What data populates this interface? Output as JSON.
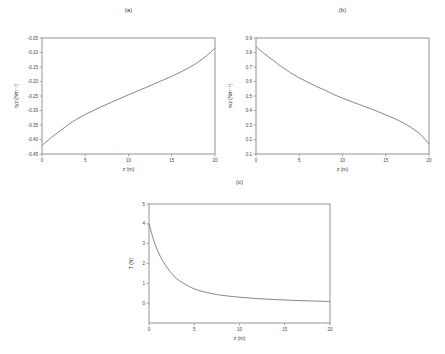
{
  "chart_data": [
    {
      "id": "a",
      "type": "line",
      "panel_label": "(a)",
      "title": "",
      "xlabel": "z (m)",
      "ylabel": "τyz (Nm⁻¹)",
      "xlim": [
        0,
        20
      ],
      "ylim": [
        -0.45,
        -0.05
      ],
      "xticks": [
        0,
        5,
        10,
        15,
        20
      ],
      "xtick_labels": [
        "0",
        "5",
        "10",
        "15",
        "20"
      ],
      "yticks": [
        -0.45,
        -0.4,
        -0.35,
        -0.3,
        -0.25,
        -0.2,
        -0.15,
        -0.1,
        -0.05
      ],
      "ytick_labels": [
        "-0.45",
        "-0.40",
        "-0.35",
        "-0.30",
        "-0.25",
        "-0.20",
        "-0.15",
        "-0.10",
        "-0.05"
      ],
      "grid": false,
      "series": [
        {
          "name": "tau_yz",
          "x": [
            0,
            1,
            2,
            3,
            4,
            5,
            6,
            7,
            8,
            9,
            10,
            11,
            12,
            13,
            14,
            15,
            16,
            17,
            18,
            19,
            20
          ],
          "y": [
            -0.42,
            -0.395,
            -0.372,
            -0.35,
            -0.33,
            -0.314,
            -0.299,
            -0.285,
            -0.272,
            -0.259,
            -0.246,
            -0.233,
            -0.221,
            -0.208,
            -0.195,
            -0.182,
            -0.168,
            -0.152,
            -0.134,
            -0.112,
            -0.085
          ]
        }
      ]
    },
    {
      "id": "b",
      "type": "line",
      "panel_label": "(b)",
      "title": "",
      "xlabel": "z (m)",
      "ylabel": "τxz (Nm⁻¹)",
      "xlim": [
        0,
        20
      ],
      "ylim": [
        0.1,
        0.9
      ],
      "xticks": [
        0,
        5,
        10,
        15,
        20
      ],
      "xtick_labels": [
        "0",
        "5",
        "10",
        "15",
        "20"
      ],
      "yticks": [
        0.1,
        0.2,
        0.3,
        0.4,
        0.5,
        0.6,
        0.7,
        0.8,
        0.9
      ],
      "ytick_labels": [
        "0.1",
        "0.2",
        "0.3",
        "0.4",
        "0.5",
        "0.6",
        "0.7",
        "0.8",
        "0.9"
      ],
      "grid": false,
      "series": [
        {
          "name": "tau_xz",
          "x": [
            0,
            1,
            2,
            3,
            4,
            5,
            6,
            7,
            8,
            9,
            10,
            11,
            12,
            13,
            14,
            15,
            16,
            17,
            18,
            19,
            20
          ],
          "y": [
            0.84,
            0.79,
            0.745,
            0.7,
            0.66,
            0.625,
            0.595,
            0.565,
            0.54,
            0.51,
            0.485,
            0.462,
            0.44,
            0.418,
            0.395,
            0.37,
            0.345,
            0.315,
            0.28,
            0.235,
            0.17
          ]
        }
      ]
    },
    {
      "id": "c",
      "type": "line",
      "panel_label": "(c)",
      "title": "",
      "xlabel": "z (m)",
      "ylabel": "T (N)",
      "xlim": [
        0,
        20
      ],
      "ylim": [
        -1,
        5
      ],
      "xticks": [
        0,
        5,
        10,
        15,
        20
      ],
      "xtick_labels": [
        "0",
        "5",
        "10",
        "15",
        "20"
      ],
      "yticks": [
        0,
        1,
        2,
        3,
        4,
        5
      ],
      "ytick_labels": [
        "0",
        "1",
        "2",
        "3",
        "4",
        "5"
      ],
      "grid": false,
      "series": [
        {
          "name": "T",
          "x": [
            0,
            0.5,
            1,
            1.5,
            2,
            2.5,
            3,
            4,
            5,
            6,
            7,
            8,
            10,
            12,
            14,
            16,
            18,
            20
          ],
          "y": [
            4.0,
            3.2,
            2.6,
            2.15,
            1.8,
            1.5,
            1.25,
            0.95,
            0.72,
            0.58,
            0.48,
            0.4,
            0.3,
            0.23,
            0.18,
            0.14,
            0.11,
            0.08
          ]
        }
      ]
    }
  ]
}
